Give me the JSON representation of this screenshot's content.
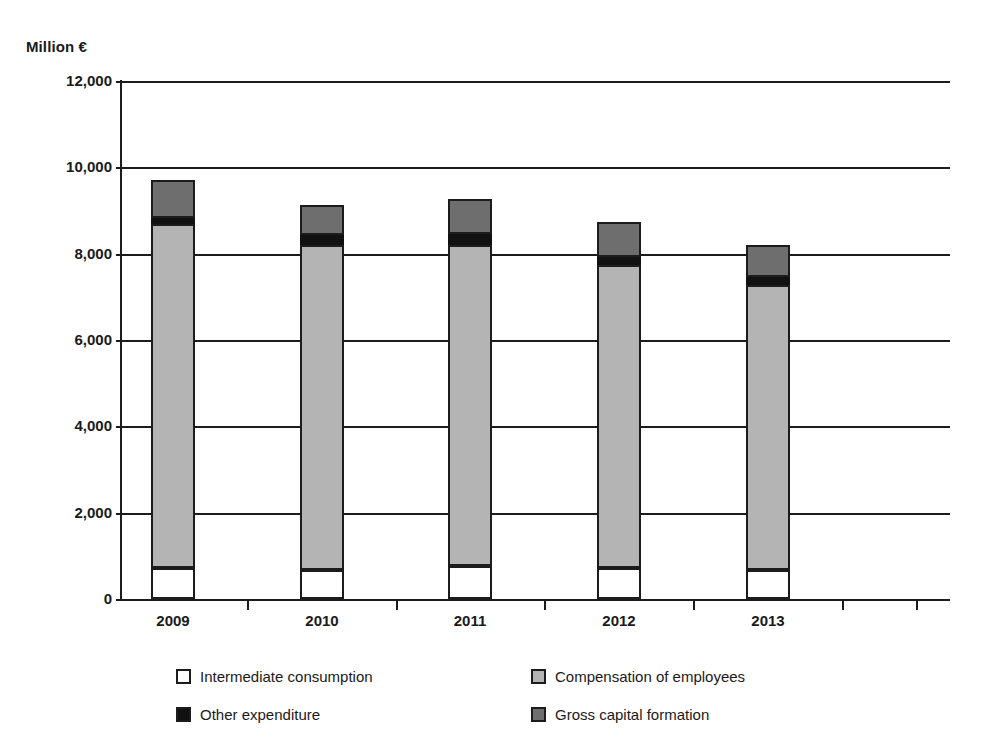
{
  "chart_data": {
    "type": "bar",
    "stacked": true,
    "title": "",
    "subtitle": "",
    "xlabel": "",
    "ylabel": "Million €",
    "ylim": [
      0,
      12000
    ],
    "yticks": [
      0,
      2000,
      4000,
      6000,
      8000,
      10000,
      12000
    ],
    "ytick_labels": [
      "0",
      "2,000",
      "4,000",
      "6,000",
      "8,000",
      "10,000",
      "12,000"
    ],
    "grid": true,
    "legend_position": "bottom",
    "categories": [
      "2009",
      "2010",
      "2011",
      "2012",
      "2013"
    ],
    "series": [
      {
        "name": "Intermediate consumption",
        "color": "#ffffff",
        "values": [
          725,
          680,
          770,
          725,
          680
        ]
      },
      {
        "name": "Compensation of employees",
        "color": "#b4b4b4",
        "values": [
          7955,
          7520,
          7430,
          7015,
          6590
        ]
      },
      {
        "name": "Other expenditure",
        "color": "#111111",
        "values": [
          140,
          230,
          260,
          190,
          190
        ]
      },
      {
        "name": "Gross capital formation",
        "color": "#6e6e6e",
        "values": [
          880,
          690,
          800,
          810,
          740
        ]
      }
    ],
    "totals": [
      9700,
      9120,
      9260,
      8740,
      8200
    ]
  },
  "legend": {
    "entries": [
      {
        "label": "Intermediate consumption",
        "swatch": "white"
      },
      {
        "label": "Compensation of employees",
        "swatch": "light-grey"
      },
      {
        "label": "Other expenditure",
        "swatch": "black"
      },
      {
        "label": "Gross capital formation",
        "swatch": "dark-grey"
      }
    ]
  }
}
